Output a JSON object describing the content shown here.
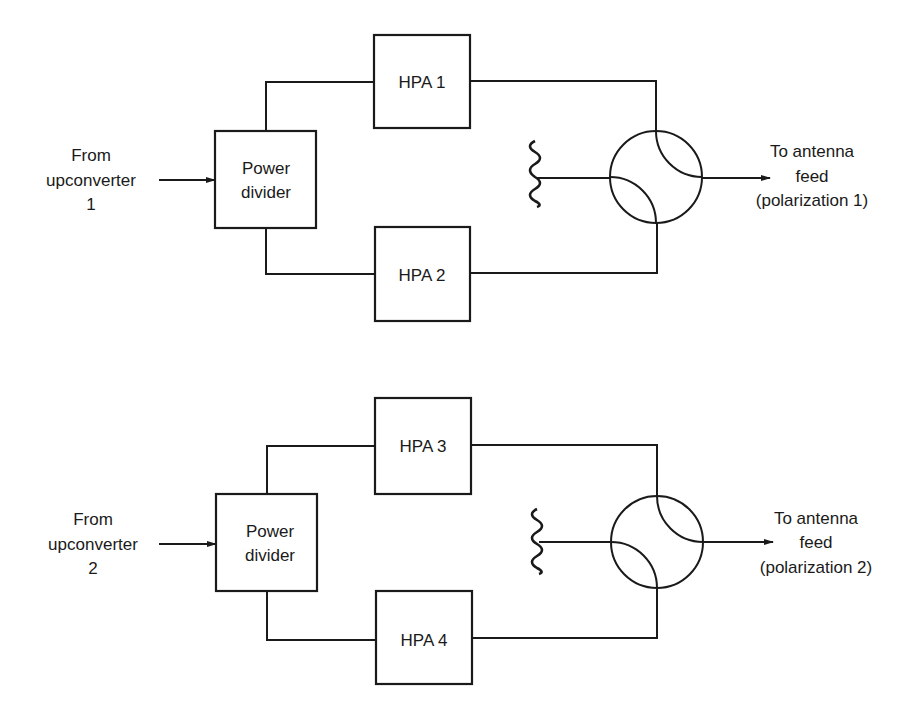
{
  "diagram": {
    "type": "block-diagram",
    "description_blocks": [
      "Power divider",
      "HPA",
      "Circulator / hybrid combiner",
      "Termination load"
    ],
    "colors": {
      "ink": "#1a1a1a",
      "background": "#ffffff"
    },
    "chains": [
      {
        "id": "chain-1",
        "input_label": [
          "From",
          "upconverter",
          "1"
        ],
        "divider_label": [
          "Power",
          "divider"
        ],
        "hpa_top": "HPA 1",
        "hpa_bottom": "HPA 2",
        "output_label": [
          "To antenna",
          "feed",
          "(polarization 1)"
        ]
      },
      {
        "id": "chain-2",
        "input_label": [
          "From",
          "upconverter",
          "2"
        ],
        "divider_label": [
          "Power",
          "divider"
        ],
        "hpa_top": "HPA 3",
        "hpa_bottom": "HPA 4",
        "output_label": [
          "To antenna",
          "feed",
          "(polarization 2)"
        ]
      }
    ]
  }
}
